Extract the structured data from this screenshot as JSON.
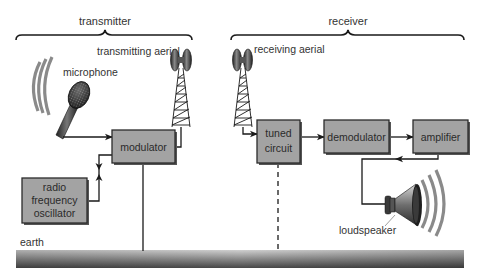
{
  "sections": {
    "transmitter": {
      "label": "transmitter"
    },
    "receiver": {
      "label": "receiver"
    }
  },
  "labels": {
    "transmitting_aerial": "transmitting aerial",
    "receiving_aerial": "receiving aerial",
    "microphone": "microphone",
    "loudspeaker": "loudspeaker",
    "earth": "earth"
  },
  "blocks": {
    "modulator": {
      "lines": [
        "modulator"
      ]
    },
    "oscillator": {
      "lines": [
        "radio",
        "frequency",
        "oscillator"
      ]
    },
    "tuned_circuit": {
      "lines": [
        "tuned",
        "circuit"
      ]
    },
    "demodulator": {
      "lines": [
        "demodulator"
      ]
    },
    "amplifier": {
      "lines": [
        "amplifier"
      ]
    }
  },
  "colors": {
    "block_fill": "#a3a3a3",
    "block_border": "#2b2b2b",
    "block_shadow": "#555555",
    "line": "#1a1a1a",
    "text": "#333333",
    "waves": "#8a8a8a",
    "earth_top": "#c8c8c8",
    "earth_bottom": "#4a4a4a"
  },
  "connections": [
    {
      "from": "microphone",
      "to": "modulator",
      "style": "solid-arrow"
    },
    {
      "from": "oscillator",
      "to": "modulator",
      "style": "solid-double-arrow"
    },
    {
      "from": "modulator",
      "to": "transmitting_aerial",
      "style": "solid"
    },
    {
      "from": "modulator",
      "to": "earth",
      "style": "solid"
    },
    {
      "from": "receiving_aerial",
      "to": "tuned_circuit",
      "style": "solid-arrow"
    },
    {
      "from": "tuned_circuit",
      "to": "demodulator",
      "style": "solid-arrow"
    },
    {
      "from": "demodulator",
      "to": "amplifier",
      "style": "solid-arrow"
    },
    {
      "from": "amplifier",
      "to": "loudspeaker",
      "style": "solid-arrow"
    },
    {
      "from": "tuned_circuit",
      "to": "earth",
      "style": "dashed"
    }
  ]
}
